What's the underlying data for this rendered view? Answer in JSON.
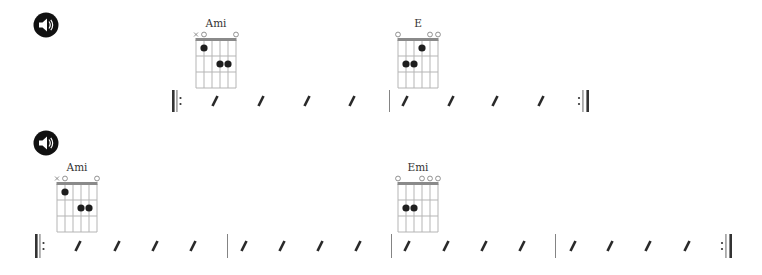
{
  "colors": {
    "grid": "#b5b5b5",
    "nut": "#8a8a8a",
    "dot": "#1e1e1e",
    "slash": "#2a2a2a",
    "barline": "#555555",
    "text": "#333333"
  },
  "systems": [
    {
      "play_button": {
        "label": "Play",
        "icon": "speaker-icon",
        "x": 33,
        "y": 12
      },
      "chords": [
        {
          "name": "Ami",
          "x": 196,
          "y": 17,
          "markers": [
            "x",
            "o",
            "",
            "",
            "",
            "o"
          ],
          "dots": [
            [
              5,
              1
            ],
            [
              3,
              2
            ],
            [
              2,
              2
            ]
          ]
        },
        {
          "name": "E",
          "x": 398,
          "y": 17,
          "markers": [
            "o",
            "",
            "",
            "",
            "o",
            "o"
          ],
          "dots": [
            [
              3,
              1
            ],
            [
              5,
              2
            ],
            [
              4,
              2
            ]
          ]
        }
      ],
      "rhythm": {
        "y": 90,
        "height": 22,
        "start_repeat_x": 172,
        "end_repeat_x": 589,
        "barlines": [
          389
        ],
        "slashes": [
          215,
          261,
          307,
          352,
          405,
          451,
          495,
          541
        ]
      }
    },
    {
      "play_button": {
        "label": "Play",
        "icon": "speaker-icon",
        "x": 33,
        "y": 130
      },
      "chords": [
        {
          "name": "Ami",
          "x": 57,
          "y": 161,
          "markers": [
            "x",
            "o",
            "",
            "",
            "",
            "o"
          ],
          "dots": [
            [
              5,
              1
            ],
            [
              3,
              2
            ],
            [
              2,
              2
            ]
          ]
        },
        {
          "name": "Emi",
          "x": 398,
          "y": 161,
          "markers": [
            "o",
            "",
            "",
            "o",
            "o",
            "o"
          ],
          "dots": [
            [
              5,
              2
            ],
            [
              4,
              2
            ]
          ]
        }
      ],
      "rhythm": {
        "y": 234,
        "height": 24,
        "start_repeat_x": 35,
        "end_repeat_x": 732,
        "barlines": [
          227,
          391,
          555
        ],
        "slashes": [
          78,
          117,
          155,
          193,
          244,
          282,
          320,
          358,
          407,
          446,
          484,
          522,
          573,
          610,
          648,
          687
        ]
      }
    }
  ]
}
